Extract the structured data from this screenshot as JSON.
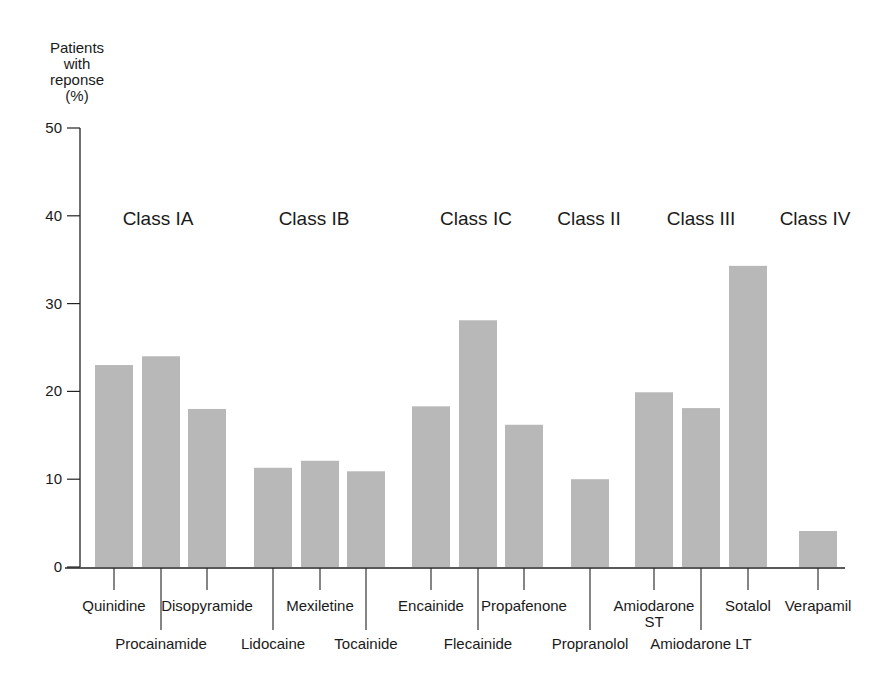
{
  "chart_data": {
    "type": "bar",
    "title": "",
    "ylabel": "Patients with reponse (%)",
    "ylabel_lines": [
      "Patients",
      "with",
      "reponse",
      "(%)"
    ],
    "xlabel": "",
    "ylim": [
      0,
      50
    ],
    "yticks": [
      0,
      10,
      20,
      30,
      40,
      50
    ],
    "grid": false,
    "bar_color": "#b8b8b8",
    "groups": [
      {
        "label": "Class IA",
        "drugs": [
          "Quinidine",
          "Procainamide",
          "Disopyramide"
        ]
      },
      {
        "label": "Class IB",
        "drugs": [
          "Lidocaine",
          "Mexiletine",
          "Tocainide"
        ]
      },
      {
        "label": "Class IC",
        "drugs": [
          "Encainide",
          "Flecainide",
          "Propafenone"
        ]
      },
      {
        "label": "Class II",
        "drugs": [
          "Propranolol"
        ]
      },
      {
        "label": "Class III",
        "drugs": [
          "Amiodarone ST",
          "Amiodarone LT",
          "Sotalol"
        ]
      },
      {
        "label": "Class IV",
        "drugs": [
          "Verapamil"
        ]
      }
    ],
    "categories": [
      "Quinidine",
      "Procainamide",
      "Disopyramide",
      "Lidocaine",
      "Mexiletine",
      "Tocainide",
      "Encainide",
      "Flecainide",
      "Propafenone",
      "Propranolol",
      "Amiodarone ST",
      "Amiodarone LT",
      "Sotalol",
      "Verapamil"
    ],
    "values": [
      23,
      24,
      18,
      11.3,
      12.1,
      10.9,
      18.3,
      28.1,
      16.2,
      10,
      19.9,
      18.1,
      34.3,
      4.1
    ]
  },
  "layout": {
    "bars": [
      {
        "x": 95,
        "label_row": 1,
        "label_lines": [
          "Quinidine"
        ]
      },
      {
        "x": 142,
        "label_row": 2,
        "label_lines": [
          "Procainamide"
        ]
      },
      {
        "x": 188,
        "label_row": 1,
        "label_lines": [
          "Disopyramide"
        ]
      },
      {
        "x": 254,
        "label_row": 2,
        "label_lines": [
          "Lidocaine"
        ]
      },
      {
        "x": 301,
        "label_row": 1,
        "label_lines": [
          "Mexiletine"
        ]
      },
      {
        "x": 347,
        "label_row": 2,
        "label_lines": [
          "Tocainide"
        ]
      },
      {
        "x": 412,
        "label_row": 1,
        "label_lines": [
          "Encainide"
        ]
      },
      {
        "x": 459,
        "label_row": 2,
        "label_lines": [
          "Flecainide"
        ]
      },
      {
        "x": 505,
        "label_row": 1,
        "label_lines": [
          "Propafenone"
        ]
      },
      {
        "x": 571,
        "label_row": 2,
        "label_lines": [
          "Propranolol"
        ]
      },
      {
        "x": 635,
        "label_row": 1,
        "label_lines": [
          "Amiodarone",
          "ST"
        ]
      },
      {
        "x": 682,
        "label_row": 2,
        "label_lines": [
          "Amiodarone LT"
        ]
      },
      {
        "x": 729,
        "label_row": 1,
        "label_lines": [
          "Sotalol"
        ]
      },
      {
        "x": 799,
        "label_row": 1,
        "label_lines": [
          "Verapamil"
        ]
      }
    ],
    "group_label_x": [
      158,
      314,
      476,
      589,
      701,
      815
    ]
  }
}
